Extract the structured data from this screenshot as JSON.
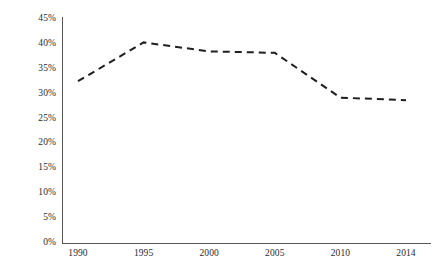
{
  "chart_data": {
    "type": "line",
    "title": "",
    "subtitle": "",
    "xlabel": "",
    "ylabel": "",
    "categories": [
      "1990",
      "1995",
      "2000",
      "2005",
      "2010",
      "2014"
    ],
    "x": [
      1990,
      1995,
      2000,
      2005,
      2010,
      2014
    ],
    "values": [
      32.5,
      40.3,
      38.5,
      38.2,
      29.2,
      28.7
    ],
    "series": [
      {
        "name": "",
        "values": [
          32.5,
          40.3,
          38.5,
          38.2,
          29.2,
          28.7
        ]
      }
    ],
    "ylim": [
      0,
      45
    ],
    "ytick_values": [
      0,
      5,
      10,
      15,
      20,
      25,
      30,
      35,
      40,
      45
    ],
    "ytick_labels": [
      "0%",
      "5%",
      "10%",
      "15%",
      "20%",
      "25%",
      "30%",
      "35%",
      "40%",
      "45%"
    ],
    "xtick_labels": [
      "1990",
      "1995",
      "2000",
      "2005",
      "2010",
      "2014"
    ],
    "grid": false,
    "legend": false,
    "legend_position": "none",
    "annotations": [],
    "line_style": "dashed",
    "markers": "none",
    "colors": {
      "line": "#1f1f22",
      "axis": "#56565a",
      "tick_label": "#2a2a2c",
      "background": "#ffffff"
    }
  },
  "axes": {
    "y_labels": [
      "45%",
      "40%",
      "35%",
      "30%",
      "25%",
      "20%",
      "15%",
      "10%",
      "5%",
      "0%"
    ],
    "x_labels": [
      "1990",
      "1995",
      "2000",
      "2005",
      "2010",
      "2014"
    ]
  }
}
